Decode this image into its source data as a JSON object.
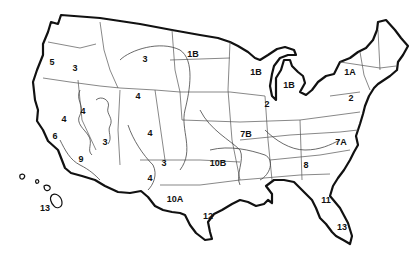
{
  "map": {
    "subject": "United States regional zone map",
    "colors": {
      "outline": "#111111",
      "boundaries": "#555555",
      "background": "#ffffff"
    },
    "zone_labels": [
      {
        "id": "z5",
        "text": "5",
        "x": 52,
        "y": 62
      },
      {
        "id": "z3a",
        "text": "3",
        "x": 75,
        "y": 68
      },
      {
        "id": "z3b",
        "text": "3",
        "x": 145,
        "y": 59
      },
      {
        "id": "z1b-a",
        "text": "1B",
        "x": 193,
        "y": 54
      },
      {
        "id": "z4a",
        "text": "4",
        "x": 138,
        "y": 96
      },
      {
        "id": "z4b",
        "text": "4",
        "x": 83,
        "y": 111
      },
      {
        "id": "z4c",
        "text": "4",
        "x": 64,
        "y": 119
      },
      {
        "id": "z4d",
        "text": "4",
        "x": 150,
        "y": 133
      },
      {
        "id": "z6",
        "text": "6",
        "x": 55,
        "y": 136
      },
      {
        "id": "z3c",
        "text": "3",
        "x": 105,
        "y": 142
      },
      {
        "id": "z9",
        "text": "9",
        "x": 81,
        "y": 159
      },
      {
        "id": "z3d",
        "text": "3",
        "x": 164,
        "y": 163
      },
      {
        "id": "z4e",
        "text": "4",
        "x": 150,
        "y": 178
      },
      {
        "id": "z10a",
        "text": "10A",
        "x": 175,
        "y": 199
      },
      {
        "id": "z12",
        "text": "12",
        "x": 208,
        "y": 216
      },
      {
        "id": "z10b",
        "text": "10B",
        "x": 218,
        "y": 163
      },
      {
        "id": "z7b",
        "text": "7B",
        "x": 246,
        "y": 134
      },
      {
        "id": "z2a",
        "text": "2",
        "x": 267,
        "y": 104
      },
      {
        "id": "z1b-b",
        "text": "1B",
        "x": 256,
        "y": 72
      },
      {
        "id": "z1b-c",
        "text": "1B",
        "x": 289,
        "y": 85
      },
      {
        "id": "z1a",
        "text": "1A",
        "x": 350,
        "y": 72
      },
      {
        "id": "z2b",
        "text": "2",
        "x": 351,
        "y": 98
      },
      {
        "id": "z7a",
        "text": "7A",
        "x": 341,
        "y": 142
      },
      {
        "id": "z8",
        "text": "8",
        "x": 306,
        "y": 165
      },
      {
        "id": "z11",
        "text": "11",
        "x": 326,
        "y": 200
      },
      {
        "id": "z13a",
        "text": "13",
        "x": 342,
        "y": 227
      },
      {
        "id": "z13b",
        "text": "13",
        "x": 45,
        "y": 208
      }
    ]
  }
}
